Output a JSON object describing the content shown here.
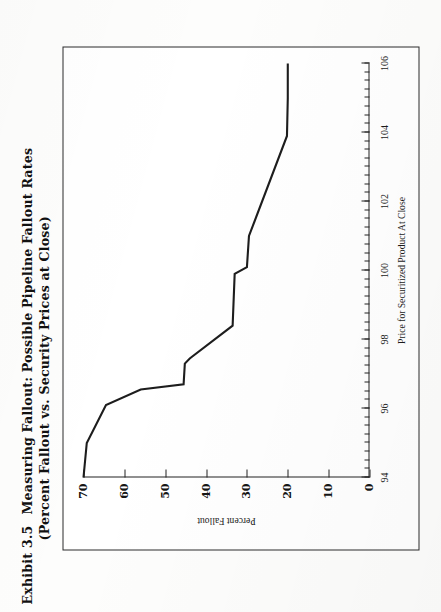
{
  "exhibit": {
    "number": "Exhibit 3.5",
    "title_line1": "Measuring Fallout: Possible Pipeline Fallout Rates",
    "title_line2": "(Percent Fallout vs. Security Prices at Close)"
  },
  "chart_data": {
    "type": "line",
    "title": "Measuring Fallout: Possible Pipeline Fallout Rates (Percent Fallout vs. Security Prices at Close)",
    "xlabel": "Price for Securitized Product At Close",
    "ylabel": "Percent Fallout",
    "xlim": [
      94,
      106
    ],
    "ylim": [
      0,
      70
    ],
    "xticks": [
      94,
      96,
      98,
      100,
      102,
      104,
      106
    ],
    "xtick_labels": [
      "94",
      "96",
      "98",
      "100",
      "102",
      "104",
      "106"
    ],
    "x_minor_step": 0.25,
    "yticks": [
      0,
      10,
      20,
      30,
      40,
      50,
      60,
      70
    ],
    "ytick_labels": [
      "0",
      "10",
      "20",
      "30",
      "40",
      "50",
      "60",
      "70"
    ],
    "grid": false,
    "legend": false,
    "series": [
      {
        "name": "Possible Pipeline Fallout Rate",
        "x": [
          94.0,
          95.0,
          96.1,
          96.55,
          96.7,
          97.3,
          97.45,
          98.4,
          99.9,
          100.1,
          101.0,
          103.9,
          105.0,
          106.0
        ],
        "y": [
          70.0,
          69.2,
          64.5,
          56.0,
          45.5,
          45.2,
          44.0,
          33.5,
          33.0,
          30.0,
          29.5,
          20.2,
          20.0,
          20.0
        ]
      }
    ]
  },
  "axis_title_x": "Price for Securitized Product At Close",
  "axis_title_y": "Percent Fallout"
}
